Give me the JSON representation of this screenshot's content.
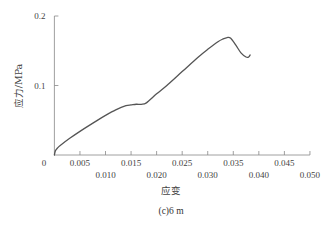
{
  "chart_data": {
    "type": "line",
    "title": "",
    "caption": "(c)6 m",
    "xlabel": "应变",
    "ylabel": "应力/MPa",
    "xlim": [
      0,
      0.05
    ],
    "ylim": [
      0,
      0.2
    ],
    "grid": false,
    "legend": null,
    "x_ticks": [
      0.005,
      0.01,
      0.015,
      0.02,
      0.025,
      0.03,
      0.035,
      0.04,
      0.045,
      0.05
    ],
    "x_tick_labels_upper": [
      "0.005",
      "0.015",
      "0.025",
      "0.035",
      "0.045"
    ],
    "x_tick_labels_lower": [
      "0.010",
      "0.020",
      "0.030",
      "0.040",
      "0.050"
    ],
    "x_origin_label": "0",
    "y_ticks": [
      0.1,
      0.2
    ],
    "y_tick_labels": [
      "0.1",
      "0.2"
    ],
    "series": [
      {
        "name": "应力-应变曲线",
        "color": "#555555",
        "x": [
          0.0,
          0.0002,
          0.0006,
          0.0012,
          0.003,
          0.005,
          0.008,
          0.01,
          0.012,
          0.014,
          0.015,
          0.016,
          0.017,
          0.018,
          0.02,
          0.022,
          0.025,
          0.028,
          0.03,
          0.032,
          0.033,
          0.0338,
          0.0345,
          0.0355,
          0.0365,
          0.0375,
          0.038,
          0.0383
        ],
        "y": [
          0.0,
          0.006,
          0.01,
          0.014,
          0.024,
          0.034,
          0.048,
          0.057,
          0.065,
          0.071,
          0.072,
          0.073,
          0.073,
          0.075,
          0.088,
          0.1,
          0.12,
          0.14,
          0.152,
          0.163,
          0.167,
          0.169,
          0.168,
          0.158,
          0.147,
          0.141,
          0.141,
          0.144
        ]
      }
    ]
  }
}
